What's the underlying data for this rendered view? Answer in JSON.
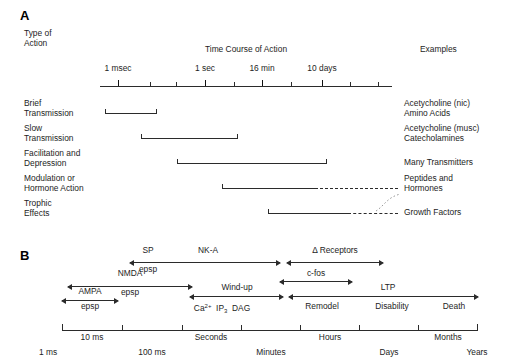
{
  "figure": {
    "panel_a_letter": "A",
    "panel_b_letter": "B"
  },
  "panel_a": {
    "col_header_left_line1": "Type of",
    "col_header_left_line2": "Action",
    "axis_title": "Time Course of Action",
    "col_header_right": "Examples",
    "axis": {
      "tick_labels": [
        "1 msec",
        "1 sec",
        "16 min",
        "10 days"
      ],
      "tick_label_x": [
        118,
        205,
        262,
        322
      ],
      "major_tick_x": [
        118,
        205,
        262,
        322
      ],
      "minor_tick_x": [
        150,
        176,
        234,
        291,
        350,
        378
      ],
      "axis_start_x": 100,
      "axis_end_x": 392
    },
    "rows": [
      {
        "label_line1": "Brief",
        "label_line2": "Transmission",
        "example_line1": "Acetycholine (nic)",
        "example_line2": "Amino Acids",
        "bar_start": 105,
        "bar_solid_end": 157,
        "bar_dashed_end": null
      },
      {
        "label_line1": "Slow",
        "label_line2": "Transmission",
        "example_line1": "Acetycholine (musc)",
        "example_line2": "Catecholamines",
        "bar_start": 141,
        "bar_solid_end": 238,
        "bar_dashed_end": null
      },
      {
        "label_line1": "Facilitation and",
        "label_line2": "Depression",
        "example_line1": "Many Transmitters",
        "example_line2": "",
        "bar_start": 177,
        "bar_solid_end": 327,
        "bar_dashed_end": null
      },
      {
        "label_line1": "Modulation or",
        "label_line2": "Hormone Action",
        "example_line1": "Peptides and",
        "example_line2": "Hormones",
        "bar_start": 222,
        "bar_solid_end": 315,
        "bar_dashed_end": 398
      },
      {
        "label_line1": "Trophic",
        "label_line2": "Effects",
        "example_line1": "Growth Factors",
        "example_line2": "",
        "bar_start": 268,
        "bar_solid_end": 348,
        "bar_dashed_end": 398
      }
    ]
  },
  "panel_b": {
    "arrows": [
      {
        "name": "sp-nka",
        "label": "SP",
        "sublabel": "epsp",
        "x1": 130,
        "x2": 280,
        "y": 262
      },
      {
        "name": "nk-a",
        "label": "NK-A",
        "sublabel": "",
        "x1": 130,
        "x2": 280,
        "y": 262
      },
      {
        "name": "delta-receptors",
        "label": "Δ Receptors",
        "sublabel": "",
        "x1": 285,
        "x2": 383,
        "y": 262
      },
      {
        "name": "nmda",
        "label": "NMDA",
        "sublabel": "epsp",
        "x1": 68,
        "x2": 192,
        "y": 283
      },
      {
        "name": "c-fos",
        "label": "c-fos",
        "sublabel": "",
        "x1": 278,
        "x2": 352,
        "y": 277
      },
      {
        "name": "windup",
        "label": "Wind-up",
        "sublabel": "",
        "x1": 190,
        "x2": 283,
        "y": 294
      },
      {
        "name": "ltp",
        "label": "LTP",
        "sublabel": "",
        "x1": 287,
        "x2": 478,
        "y": 294
      },
      {
        "name": "ampa",
        "label": "AMPA",
        "sublabel": "epsp",
        "x1": 62,
        "x2": 118,
        "y": 300
      }
    ],
    "text_labels": [
      {
        "name": "label-sp",
        "text": "SP",
        "x": 148,
        "y": 251
      },
      {
        "name": "label-nka",
        "text": "NK-A",
        "x": 208,
        "y": 251
      },
      {
        "name": "label-delta-receptors",
        "text": "Δ Receptors",
        "x": 333,
        "y": 251
      },
      {
        "name": "label-sp-epsp",
        "text": "epsp",
        "x": 148,
        "y": 266
      },
      {
        "name": "label-nmda",
        "text": "NMDA",
        "x": 130,
        "y": 272
      },
      {
        "name": "label-c-fos",
        "text": "c-fos",
        "x": 314,
        "y": 268
      },
      {
        "name": "label-nmda-epsp",
        "text": "epsp",
        "x": 130,
        "y": 286
      },
      {
        "name": "label-windup",
        "text": "Wind-up",
        "x": 236,
        "y": 284
      },
      {
        "name": "label-ltp",
        "text": "LTP",
        "x": 386,
        "y": 284
      },
      {
        "name": "label-ampa",
        "text": "AMPA",
        "x": 90,
        "y": 289
      },
      {
        "name": "label-ampa-epsp",
        "text": "epsp",
        "x": 90,
        "y": 305
      },
      {
        "name": "label-remodel",
        "text": "Remodel",
        "x": 320,
        "y": 304
      },
      {
        "name": "label-disability",
        "text": "Disability",
        "x": 390,
        "y": 304
      },
      {
        "name": "label-death",
        "text": "Death",
        "x": 452,
        "y": 304
      },
      {
        "name": "label-dag",
        "text": "DAG",
        "x": 265,
        "y": 304
      }
    ],
    "calcium_label": {
      "ion": "Ca",
      "charge": "2+",
      "ip3_main": "IP",
      "ip3_sub": "3",
      "x": 196,
      "y": 304
    },
    "axis": {
      "start_x": 62,
      "end_x": 478,
      "tick_x": [
        62,
        122,
        182,
        241,
        300,
        359,
        418,
        478
      ],
      "upper_labels": [
        "10 ms",
        "Seconds",
        "Hours",
        "Months"
      ],
      "upper_label_x": [
        92,
        211,
        330,
        448
      ],
      "lower_labels": [
        "1 ms",
        "100 ms",
        "Minutes",
        "Days",
        "Years"
      ],
      "lower_label_x": [
        48,
        152,
        271,
        389,
        477
      ]
    }
  }
}
